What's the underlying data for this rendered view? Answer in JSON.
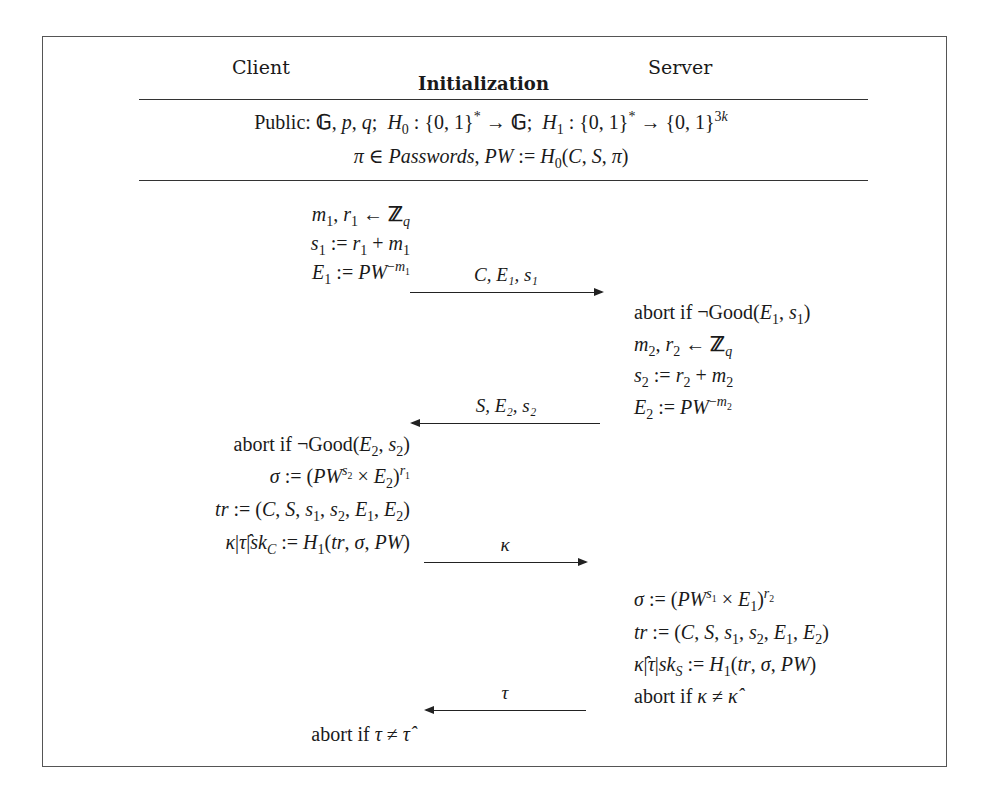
{
  "header": {
    "client_label": "Client",
    "server_label": "Server",
    "section_label": "Initialization"
  },
  "public": {
    "line1": "Public: 𝔾, p, q;  H₀ : {0,1}* → 𝔾;  H₁ : {0,1}* → {0,1}³ᵏ",
    "line2": "π ∈ Passwords, PW := H₀(C, S, π)"
  },
  "client_steps": [
    "m₁, r₁ ← ℤ_q",
    "s₁ := r₁ + m₁",
    "E₁ := PW^(−m₁)",
    "abort if ¬Good(E₂, s₂)",
    "σ := (PW^(s₂) × E₂)^(r₁)",
    "tr := (C, S, s₁, s₂, E₁, E₂)",
    "κ|τ̂|sk_C := H₁(tr, σ, PW)",
    "abort if τ ≠ τ̂"
  ],
  "server_steps": [
    "abort if ¬Good(E₁, s₁)",
    "m₂, r₂ ← ℤ_q",
    "s₂ := r₂ + m₂",
    "E₂ := PW^(−m₂)",
    "σ := (PW^(s₁) × E₁)^(r₂)",
    "tr := (C, S, s₁, s₂, E₁, E₂)",
    "κ̂|τ|sk_S := H₁(tr, σ, PW)",
    "abort if κ ≠ κ̂"
  ],
  "messages": [
    {
      "label": "C, E₁, s₁",
      "direction": "client-to-server"
    },
    {
      "label": "S, E₂, s₂",
      "direction": "server-to-client"
    },
    {
      "label": "κ",
      "direction": "client-to-server"
    },
    {
      "label": "τ",
      "direction": "server-to-client"
    }
  ]
}
